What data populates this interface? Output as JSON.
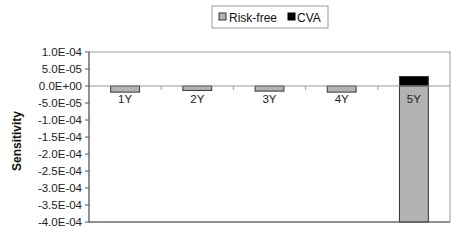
{
  "chart_data": {
    "type": "bar",
    "stacked": true,
    "title": "",
    "xlabel": "",
    "ylabel": "Sensitivity",
    "categories": [
      "1Y",
      "2Y",
      "3Y",
      "4Y",
      "5Y"
    ],
    "series": [
      {
        "name": "Risk-free",
        "color": "#b3b3b3",
        "values": [
          -1.8e-05,
          -1.3e-05,
          -1.5e-05,
          -1.8e-05,
          -0.0004
        ]
      },
      {
        "name": "CVA",
        "color": "#000000",
        "values": [
          0,
          0,
          0,
          0,
          2.8e-05
        ]
      }
    ],
    "ylim": [
      -0.0004,
      0.0001
    ],
    "ytick_step": 5e-05,
    "ytick_labels": [
      "1.0E-04",
      "5.0E-05",
      "0.0E+00",
      "-5.0E-05",
      "-1.0E-04",
      "-1.5E-04",
      "-2.0E-04",
      "-2.5E-04",
      "-3.0E-04",
      "-3.5E-04",
      "-4.0E-04"
    ],
    "grid": false,
    "legend": {
      "position": "top-center",
      "entries": [
        "Risk-free",
        "CVA"
      ]
    }
  }
}
